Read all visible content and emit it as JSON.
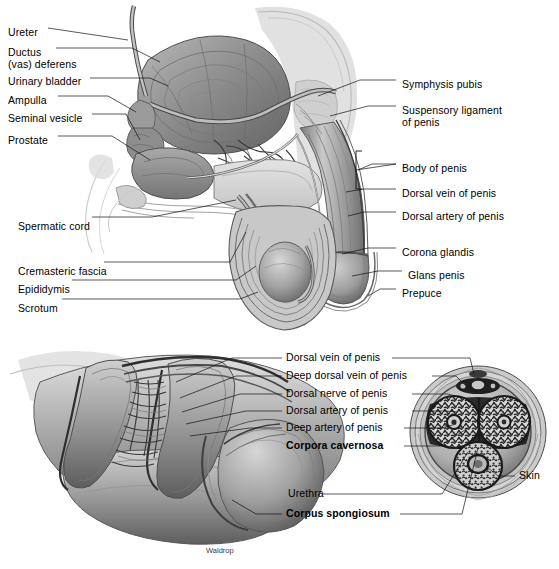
{
  "figure": {
    "credit": "Waldrop",
    "background": "#ffffff",
    "text_color": "#000000"
  },
  "upper_panel": {
    "name": "sagittal-section-male-pelvis",
    "labels_left": [
      {
        "text": "Ureter",
        "x": 8,
        "y": 26
      },
      {
        "text": "Ductus",
        "x": 8,
        "y": 46
      },
      {
        "text": "(vas) deferens",
        "x": 8,
        "y": 58
      },
      {
        "text": "Urinary bladder",
        "x": 8,
        "y": 75
      },
      {
        "text": "Ampulla",
        "x": 8,
        "y": 94
      },
      {
        "text": "Seminal vesicle",
        "x": 8,
        "y": 112
      },
      {
        "text": "Prostate",
        "x": 8,
        "y": 134
      },
      {
        "text": "Spermatic cord",
        "x": 18,
        "y": 220
      },
      {
        "text": "Cremasteric fascia",
        "x": 18,
        "y": 265
      },
      {
        "text": "Epididymis",
        "x": 18,
        "y": 283
      },
      {
        "text": "Scrotum",
        "x": 18,
        "y": 302
      }
    ],
    "labels_right": [
      {
        "text": "Symphysis pubis",
        "x": 402,
        "y": 78
      },
      {
        "text": "Suspensory ligament",
        "x": 402,
        "y": 104
      },
      {
        "text": "of penis",
        "x": 402,
        "y": 116
      },
      {
        "text": "Body of penis",
        "x": 402,
        "y": 162
      },
      {
        "text": "Dorsal vein of penis",
        "x": 402,
        "y": 187
      },
      {
        "text": "Dorsal artery of penis",
        "x": 402,
        "y": 210
      },
      {
        "text": "Corona glandis",
        "x": 402,
        "y": 246
      },
      {
        "text": "Glans penis",
        "x": 408,
        "y": 269
      },
      {
        "text": "Prepuce",
        "x": 402,
        "y": 287
      }
    ]
  },
  "lower_panel": {
    "name": "penis-dissection-and-cross-section",
    "labels": [
      {
        "text": "Dorsal vein of penis",
        "x": 286,
        "y": 356,
        "bold": false
      },
      {
        "text": "Deep dorsal vein of penis",
        "x": 286,
        "y": 374,
        "bold": false
      },
      {
        "text": "Dorsal nerve of penis",
        "x": 286,
        "y": 392,
        "bold": false
      },
      {
        "text": "Dorsal artery of penis",
        "x": 286,
        "y": 409,
        "bold": false
      },
      {
        "text": "Deep artery of penis",
        "x": 286,
        "y": 426,
        "bold": false
      },
      {
        "text": "Corpora cavernosa",
        "x": 286,
        "y": 444,
        "bold": true
      },
      {
        "text": "Urethra",
        "x": 288,
        "y": 492,
        "bold": false
      },
      {
        "text": "Corpus spongiosum",
        "x": 286,
        "y": 512,
        "bold": true
      },
      {
        "text": "Skin",
        "x": 519,
        "y": 474,
        "bold": false
      }
    ]
  }
}
